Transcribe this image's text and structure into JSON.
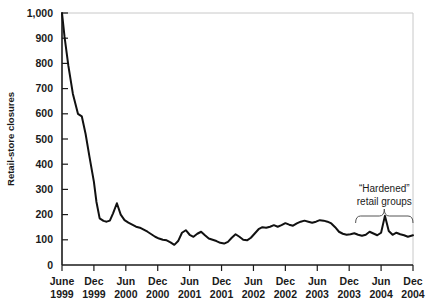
{
  "chart_data": {
    "type": "line",
    "title": "",
    "xlabel": "",
    "ylabel": "Retail-store closures",
    "ylim": [
      0,
      1000
    ],
    "ytick_values": [
      0,
      100,
      200,
      300,
      400,
      500,
      600,
      700,
      800,
      900,
      1000
    ],
    "ytick_labels": [
      "0",
      "100",
      "200",
      "300",
      "400",
      "500",
      "600",
      "700",
      "800",
      "900",
      "1,000"
    ],
    "xtick_labels": [
      {
        "month": "June",
        "year": "1999"
      },
      {
        "month": "Dec",
        "year": "1999"
      },
      {
        "month": "Jun",
        "year": "2000"
      },
      {
        "month": "Dec",
        "year": "2000"
      },
      {
        "month": "Jun",
        "year": "2001"
      },
      {
        "month": "Dec",
        "year": "2001"
      },
      {
        "month": "Jun",
        "year": "2002"
      },
      {
        "month": "Dec",
        "year": "2002"
      },
      {
        "month": "Jun",
        "year": "2003"
      },
      {
        "month": "Dec",
        "year": "2003"
      },
      {
        "month": "Jun",
        "year": "2004"
      },
      {
        "month": "Dec",
        "year": "2004"
      }
    ],
    "grid": false,
    "legend": "none",
    "line_color": "#111111",
    "series": [
      {
        "name": "Retail-store closures",
        "x": [
          0.0,
          0.08,
          0.2,
          0.34,
          0.5,
          0.62,
          0.74,
          0.86,
          1.0,
          1.08,
          1.18,
          1.3,
          1.4,
          1.5,
          1.6,
          1.72,
          1.84,
          1.96,
          2.08,
          2.2,
          2.32,
          2.44,
          2.56,
          2.68,
          2.8,
          2.92,
          3.04,
          3.16,
          3.28,
          3.4,
          3.52,
          3.64,
          3.76,
          3.88,
          4.0,
          4.12,
          4.24,
          4.36,
          4.48,
          4.6,
          4.72,
          4.84,
          4.96,
          5.08,
          5.2,
          5.32,
          5.44,
          5.56,
          5.68,
          5.8,
          5.92,
          6.04,
          6.16,
          6.28,
          6.4,
          6.52,
          6.64,
          6.76,
          6.88,
          7.0,
          7.12,
          7.24,
          7.36,
          7.48,
          7.6,
          7.72,
          7.84,
          7.96,
          8.08,
          8.2,
          8.32,
          8.44,
          8.56,
          8.68,
          8.8,
          8.92,
          9.04,
          9.16,
          9.28,
          9.4,
          9.52,
          9.64,
          9.76,
          9.88,
          10.0,
          10.12,
          10.24,
          10.36,
          10.48,
          10.6,
          10.72,
          10.84,
          11.0
        ],
        "values": [
          1000,
          905,
          790,
          680,
          600,
          590,
          520,
          430,
          330,
          250,
          185,
          175,
          172,
          176,
          205,
          245,
          200,
          178,
          168,
          160,
          152,
          148,
          140,
          132,
          122,
          112,
          105,
          100,
          98,
          90,
          80,
          95,
          128,
          138,
          120,
          112,
          124,
          132,
          118,
          105,
          100,
          95,
          88,
          85,
          92,
          108,
          122,
          112,
          100,
          98,
          108,
          125,
          142,
          150,
          148,
          152,
          158,
          152,
          158,
          166,
          160,
          156,
          165,
          172,
          176,
          172,
          168,
          172,
          178,
          176,
          172,
          165,
          150,
          132,
          124,
          120,
          122,
          126,
          120,
          116,
          120,
          132,
          125,
          118,
          128,
          195,
          135,
          120,
          128,
          122,
          118,
          112,
          118
        ]
      }
    ],
    "annotations": [
      {
        "name": "hardened-retail-groups",
        "line1": "“Hardened”",
        "line2": "retail groups",
        "brace_x_start": 9.2,
        "brace_x_end": 11.0
      }
    ]
  }
}
